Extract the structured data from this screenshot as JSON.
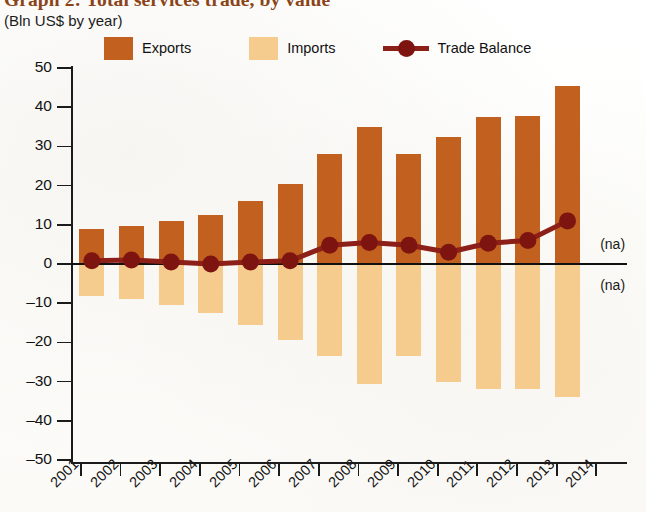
{
  "header": {
    "title": "Graph 2: Total services trade, by value",
    "subtitle": "(Bln US$ by year)"
  },
  "legend": {
    "exports_label": "Exports",
    "imports_label": "Imports",
    "balance_label": "Trade Balance",
    "exports_color": "#c2611f",
    "imports_color": "#f6cc8e",
    "balance_color": "#8c1f18"
  },
  "annotations": [
    {
      "text": "(na)",
      "year": "2014",
      "position": "above-axis"
    },
    {
      "text": "(na)",
      "year": "2014",
      "position": "below-axis"
    }
  ],
  "chart_data": {
    "type": "bar",
    "title": "Graph 2: Total services trade, by value",
    "subtitle": "(Bln US$ by year)",
    "xlabel": "",
    "ylabel": "Bln US$",
    "ylim": [
      -50,
      50
    ],
    "yticks": [
      50,
      40,
      30,
      20,
      10,
      0,
      -10,
      -20,
      -30,
      -40,
      -50
    ],
    "ytick_labels": [
      "50",
      "40",
      "30",
      "20",
      "10",
      "0",
      "–10",
      "–20",
      "–30",
      "–40",
      "–50"
    ],
    "grid": false,
    "legend_position": "top",
    "categories": [
      "2001",
      "2002",
      "2003",
      "2004",
      "2005",
      "2006",
      "2007",
      "2008",
      "2009",
      "2010",
      "2011",
      "2012",
      "2013",
      "2014"
    ],
    "series": [
      {
        "name": "Exports",
        "type": "bar",
        "color": "#c2611f",
        "values": [
          9.0,
          9.8,
          11.0,
          12.5,
          16.0,
          20.3,
          28.0,
          35.0,
          28.0,
          32.5,
          37.5,
          37.7,
          45.3,
          null
        ]
      },
      {
        "name": "Imports",
        "type": "bar",
        "color": "#f6cc8e",
        "values": [
          -8.2,
          -9.0,
          -10.5,
          -12.5,
          -15.5,
          -19.5,
          -23.5,
          -30.5,
          -23.5,
          -30.0,
          -32.0,
          -32.0,
          -34.0,
          null
        ]
      },
      {
        "name": "Trade Balance",
        "type": "line",
        "color": "#8c1f18",
        "values": [
          0.8,
          1.0,
          0.5,
          0.0,
          0.5,
          0.8,
          4.8,
          5.5,
          4.8,
          3.0,
          5.3,
          6.0,
          11.0,
          null
        ]
      }
    ]
  }
}
